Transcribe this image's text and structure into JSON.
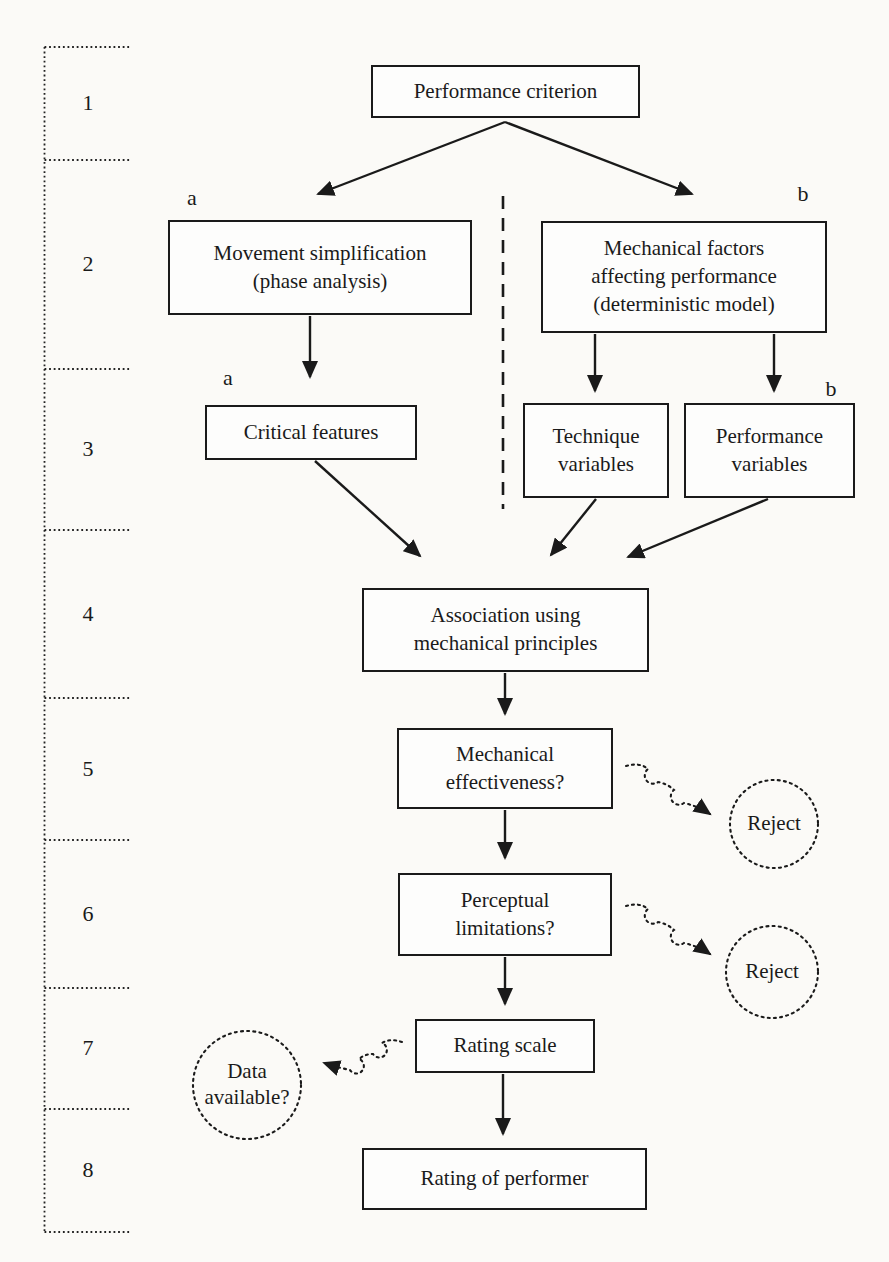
{
  "diagram": {
    "stages": [
      "1",
      "2",
      "3",
      "4",
      "5",
      "6",
      "7",
      "8"
    ],
    "branch_labels": {
      "row2_left": "a",
      "row2_right": "b",
      "row3_left": "a",
      "row3_right": "b"
    },
    "boxes": {
      "performance_criterion": [
        "Performance criterion"
      ],
      "movement_simplification": [
        "Movement simplification",
        "(phase analysis)"
      ],
      "mechanical_factors": [
        "Mechanical factors",
        "affecting performance",
        "(deterministic model)"
      ],
      "critical_features": [
        "Critical features"
      ],
      "technique_variables": [
        "Technique",
        "variables"
      ],
      "performance_variables": [
        "Performance",
        "variables"
      ],
      "association_mechanical_principles": [
        "Association using",
        "mechanical principles"
      ],
      "mechanical_effectiveness": [
        "Mechanical",
        "effectiveness?"
      ],
      "perceptual_limitations": [
        "Perceptual",
        "limitations?"
      ],
      "rating_scale": [
        "Rating scale"
      ],
      "rating_of_performer": [
        "Rating of performer"
      ]
    },
    "callouts": {
      "reject_1": [
        "Reject"
      ],
      "reject_2": [
        "Reject"
      ],
      "data_available": [
        "Data",
        "available?"
      ]
    },
    "colors": {
      "ink": "#1a1a1a",
      "paper": "#fbfaf7"
    }
  }
}
